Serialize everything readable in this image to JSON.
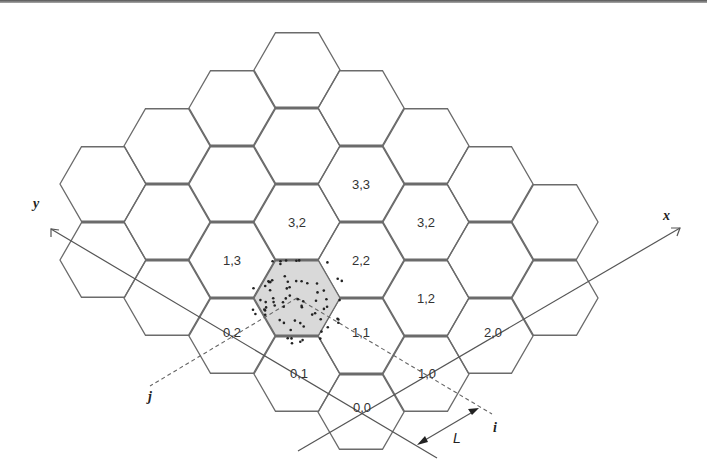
{
  "figure": {
    "hex_grid": {
      "orientation": "flat-top",
      "radius": 43,
      "columns": [
        {
          "x": 103,
          "ys": [
            184,
            260
          ]
        },
        {
          "x": 167,
          "ys": [
            146,
            222,
            298
          ]
        },
        {
          "x": 232,
          "ys": [
            108,
            184,
            260,
            336
          ]
        },
        {
          "x": 297,
          "ys": [
            70,
            146,
            222,
            298,
            374
          ]
        },
        {
          "x": 361,
          "ys": [
            108,
            184,
            260,
            336,
            412
          ]
        },
        {
          "x": 426,
          "ys": [
            146,
            222,
            298,
            374
          ]
        },
        {
          "x": 490,
          "ys": [
            184,
            260,
            336
          ]
        },
        {
          "x": 555,
          "ys": [
            222,
            298
          ]
        }
      ],
      "shaded_cell": {
        "x": 297,
        "y": 298
      }
    },
    "cell_labels": [
      {
        "text": "3,3",
        "x": 361,
        "y": 184
      },
      {
        "text": "3,2",
        "x": 297,
        "y": 222
      },
      {
        "text": "3,2",
        "x": 426,
        "y": 222
      },
      {
        "text": "1,3",
        "x": 232,
        "y": 260
      },
      {
        "text": "2,2",
        "x": 361,
        "y": 260
      },
      {
        "text": "1,2",
        "x": 426,
        "y": 298
      },
      {
        "text": "0,2",
        "x": 232,
        "y": 332
      },
      {
        "text": "1,1",
        "x": 361,
        "y": 332
      },
      {
        "text": "2,0",
        "x": 493,
        "y": 332
      },
      {
        "text": "0,1",
        "x": 299,
        "y": 373
      },
      {
        "text": "1,0",
        "x": 427,
        "y": 373
      },
      {
        "text": "0,0",
        "x": 362,
        "y": 407
      }
    ],
    "axes": {
      "x_label": "x",
      "y_label": "y",
      "i_label": "i",
      "j_label": "j",
      "length_label": "L"
    }
  }
}
